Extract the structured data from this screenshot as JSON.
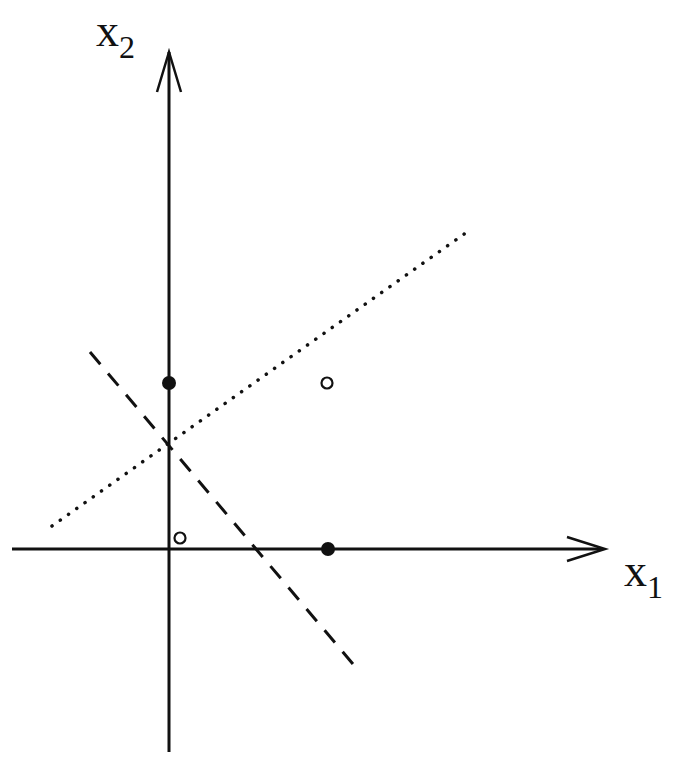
{
  "diagram": {
    "type": "2d-feature-space",
    "axes": {
      "x": {
        "label": "x",
        "subscript": "1"
      },
      "y": {
        "label": "x",
        "subscript": "2"
      }
    },
    "points": [
      {
        "id": "p1",
        "x": 0,
        "y": 1,
        "style": "filled"
      },
      {
        "id": "p2",
        "x": 1,
        "y": 0,
        "style": "filled"
      },
      {
        "id": "p3",
        "x": 0.06,
        "y": 0.06,
        "style": "open"
      },
      {
        "id": "p4",
        "x": 1,
        "y": 1,
        "style": "open"
      }
    ],
    "lines": [
      {
        "id": "dotted-line",
        "style": "dotted",
        "from": [
          52,
          526
        ],
        "to": [
          467,
          232
        ]
      },
      {
        "id": "dashed-line",
        "style": "dashed",
        "from": [
          90,
          352
        ],
        "to": [
          358,
          670
        ]
      }
    ],
    "colors": {
      "ink": "#111111",
      "background": "#ffffff"
    }
  }
}
